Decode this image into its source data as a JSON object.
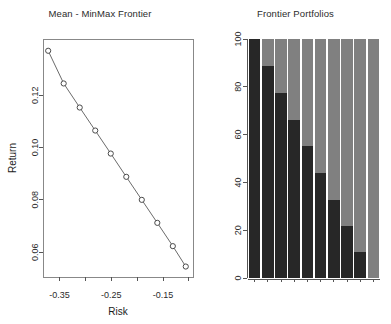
{
  "figure": {
    "background": "#ffffff",
    "width": 391,
    "height": 324
  },
  "panels": {
    "left": {
      "title": "Mean - MinMax Frontier",
      "xlabel": "Risk",
      "ylabel": "Return"
    },
    "right": {
      "title": "Frontier Portfolios",
      "xlabel": "",
      "ylabel": ""
    }
  },
  "colors": {
    "point_stroke": "#4a4a4a",
    "point_fill": "#ffffff",
    "line": "#6b6b6b",
    "bar_asset_1": "#272727",
    "bar_asset_2": "#808080",
    "axis": "#555555",
    "frame": "#888888",
    "text": "#2b2b2b"
  },
  "chart_data": [
    {
      "type": "scatter",
      "title": "Mean - MinMax Frontier",
      "xlabel": "Risk",
      "ylabel": "Return",
      "marker": "open-circle",
      "connected": true,
      "xlim": [
        -0.382,
        -0.092
      ],
      "ylim": [
        0.0505,
        0.1415
      ],
      "xticks": [
        -0.35,
        -0.3,
        -0.25,
        -0.2,
        -0.15,
        -0.1
      ],
      "xticklabels": [
        "-0.35",
        "",
        "-0.25",
        "",
        "-0.15",
        ""
      ],
      "yticks": [
        0.06,
        0.08,
        0.1,
        0.12
      ],
      "yticklabels": [
        "0.06",
        "0.08",
        "0.10",
        "0.12"
      ],
      "grid": false,
      "x": [
        -0.372,
        -0.342,
        -0.311,
        -0.281,
        -0.251,
        -0.221,
        -0.191,
        -0.161,
        -0.131,
        -0.106
      ],
      "y": [
        0.137,
        0.1245,
        0.1153,
        0.1065,
        0.0977,
        0.0888,
        0.08,
        0.0712,
        0.0623,
        0.0545
      ],
      "point_labels": [
        "P1",
        "P2",
        "P3",
        "P4",
        "P5",
        "P6",
        "P7",
        "P8",
        "P9",
        "P10"
      ]
    },
    {
      "type": "bar",
      "subtype": "stacked-percent",
      "title": "Frontier Portfolios",
      "xlabel": "",
      "ylabel": "",
      "ylim": [
        0,
        100
      ],
      "yticks": [
        0,
        20,
        40,
        60,
        80,
        100
      ],
      "yticklabels": [
        "0",
        "20",
        "40",
        "60",
        "80",
        "100"
      ],
      "grid": false,
      "categories": [
        "P1",
        "P2",
        "P3",
        "P4",
        "P5",
        "P6",
        "P7",
        "P8",
        "P9",
        "P10"
      ],
      "series": [
        {
          "name": "Asset 1",
          "color": "#272727",
          "values": [
            100,
            88.7,
            77.6,
            66.3,
            55.2,
            44.0,
            32.8,
            21.7,
            10.8,
            0
          ]
        },
        {
          "name": "Asset 2",
          "color": "#808080",
          "values": [
            0,
            11.3,
            22.4,
            33.7,
            44.8,
            56.0,
            67.2,
            78.3,
            89.2,
            100
          ]
        }
      ]
    }
  ]
}
